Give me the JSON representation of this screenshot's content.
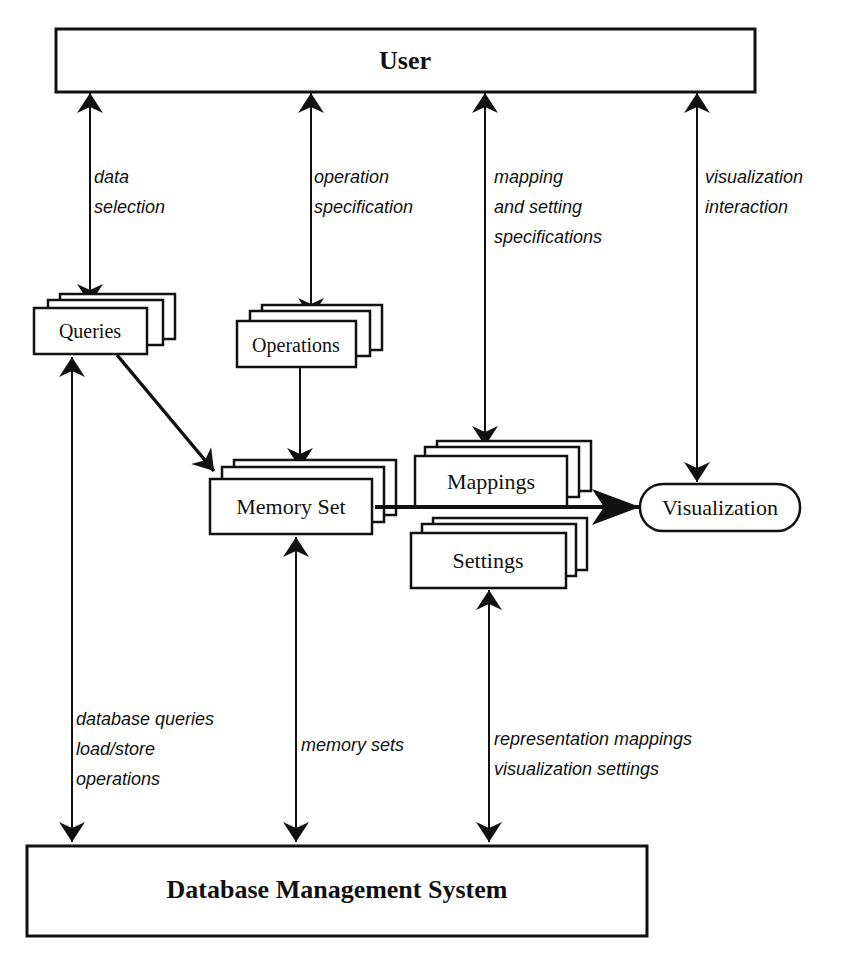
{
  "diagram": {
    "nodes": {
      "user": {
        "label": "User"
      },
      "queries": {
        "label": "Queries"
      },
      "operations": {
        "label": "Operations"
      },
      "memory_set": {
        "label": "Memory Set"
      },
      "mappings": {
        "label": "Mappings"
      },
      "settings": {
        "label": "Settings"
      },
      "visualization": {
        "label": "Visualization"
      },
      "dbms": {
        "label": "Database Management System"
      }
    },
    "edge_labels": {
      "data_selection": [
        "data",
        "selection"
      ],
      "operation_specification": [
        "operation",
        "specification"
      ],
      "mapping_setting_spec": [
        "mapping",
        "and setting",
        "specifications"
      ],
      "visualization_interaction": [
        "visualization",
        "interaction"
      ],
      "db_queries": [
        "database queries",
        "load/store",
        "operations"
      ],
      "memory_sets": [
        "memory sets"
      ],
      "representation": [
        "representation mappings",
        "visualization settings"
      ]
    },
    "colors": {
      "stroke": "#111111",
      "background": "#ffffff"
    }
  }
}
